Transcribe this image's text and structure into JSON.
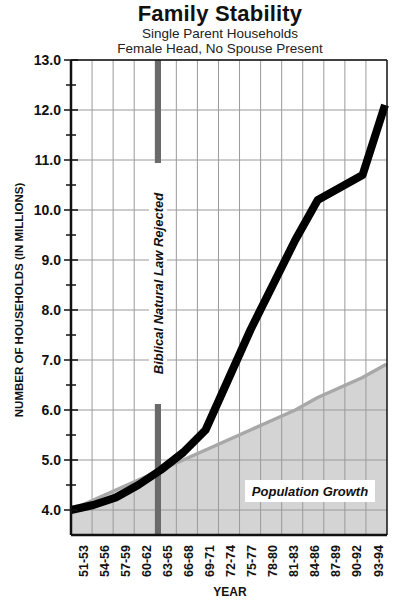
{
  "header": {
    "title": "Family Stability",
    "subtitle_line1": "Single Parent Households",
    "subtitle_line2": "Female Head, No Spouse Present"
  },
  "axes": {
    "ylabel": "NUMBER OF HOUSEHOLDS (IN MILLIONS)",
    "xlabel": "YEAR"
  },
  "colors": {
    "main_line": "#000000",
    "population_fill": "#d4d4d4",
    "population_line": "#a8a8a8",
    "annotation_bar": "#6a6a6a",
    "grid": "#9a9a9a"
  },
  "annotations": {
    "vertical_marker": "Biblical Natural Law Rejected",
    "area_label": "Population Growth"
  },
  "chart_data": {
    "type": "line",
    "title": "Family Stability",
    "subtitle": "Single Parent Households — Female Head, No Spouse Present",
    "xlabel": "YEAR",
    "ylabel": "NUMBER OF HOUSEHOLDS (IN MILLIONS)",
    "ylim": [
      3.5,
      13.0
    ],
    "yticks": [
      "4.0",
      "5.0",
      "6.0",
      "7.0",
      "8.0",
      "9.0",
      "10.0",
      "11.0",
      "12.0",
      "13.0"
    ],
    "grid": true,
    "categories": [
      "51-53",
      "54-56",
      "57-59",
      "60-62",
      "63-65",
      "66-68",
      "69-71",
      "72-74",
      "75-77",
      "78-80",
      "81-83",
      "84-86",
      "87-89",
      "90-92",
      "93-94"
    ],
    "series": [
      {
        "name": "Single Parent Households (Female Head, No Spouse Present)",
        "style": "thick black line",
        "values": [
          4.0,
          4.1,
          4.25,
          4.5,
          4.8,
          5.15,
          5.6,
          6.6,
          7.6,
          8.5,
          9.4,
          10.2,
          10.45,
          10.7,
          12.1
        ]
      },
      {
        "name": "Population Growth",
        "style": "gray shaded area",
        "values": [
          4.0,
          4.2,
          4.4,
          4.6,
          4.8,
          5.0,
          5.2,
          5.4,
          5.6,
          5.8,
          6.0,
          6.25,
          6.45,
          6.65,
          6.9
        ]
      }
    ],
    "annotations": [
      {
        "text": "Biblical Natural Law Rejected",
        "type": "vertical-line",
        "x": "63-65"
      },
      {
        "text": "Population Growth",
        "type": "area-label"
      }
    ]
  }
}
